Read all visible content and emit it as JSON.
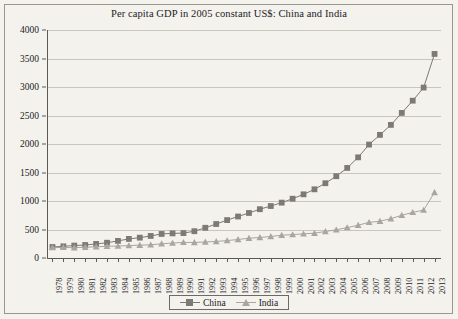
{
  "chart_data": {
    "type": "line",
    "title": "Per capita GDP in 2005 constant US$: China and India",
    "xlabel": "",
    "ylabel": "",
    "ylim": [
      0,
      4000
    ],
    "ytick_step": 500,
    "yticks": [
      "0",
      "500",
      "1000",
      "1500",
      "2000",
      "2500",
      "3000",
      "3500",
      "4000"
    ],
    "grid": true,
    "legend_position": "bottom-center",
    "x": [
      "1978",
      "1979",
      "1980",
      "1981",
      "1982",
      "1983",
      "1984",
      "1985",
      "1986",
      "1987",
      "1988",
      "1989",
      "1990",
      "1991",
      "1992",
      "1993",
      "1994",
      "1995",
      "1996",
      "1997",
      "1998",
      "1999",
      "2000",
      "2001",
      "2002",
      "2003",
      "2004",
      "2005",
      "2006",
      "2007",
      "2008",
      "2009",
      "2010",
      "2011",
      "2012",
      "2013"
    ],
    "series": [
      {
        "name": "China",
        "marker": "square",
        "color": "#7d7a75",
        "values": [
          193,
          205,
          218,
          228,
          247,
          268,
          300,
          335,
          357,
          387,
          422,
          432,
          437,
          470,
          530,
          596,
          665,
          728,
          790,
          856,
          912,
          971,
          1040,
          1117,
          1205,
          1312,
          1435,
          1580,
          1766,
          1990,
          2160,
          2335,
          2545,
          2760,
          2990,
          3580
        ]
      },
      {
        "name": "India",
        "marker": "triangle",
        "color": "#a9a6a0",
        "values": [
          182,
          186,
          180,
          190,
          195,
          205,
          210,
          218,
          225,
          232,
          250,
          262,
          274,
          272,
          281,
          291,
          305,
          325,
          347,
          360,
          377,
          400,
          410,
          425,
          435,
          465,
          495,
          533,
          575,
          625,
          645,
          690,
          750,
          800,
          840,
          1150
        ]
      }
    ]
  },
  "legend": {
    "items": [
      {
        "label": "China"
      },
      {
        "label": "India"
      }
    ]
  },
  "colors": {
    "china": "#7d7a75",
    "india": "#a9a6a0",
    "axis": "#5d5a55",
    "grid": "#c9c6c0",
    "background": "#f4f2ed",
    "text": "#23211f"
  }
}
